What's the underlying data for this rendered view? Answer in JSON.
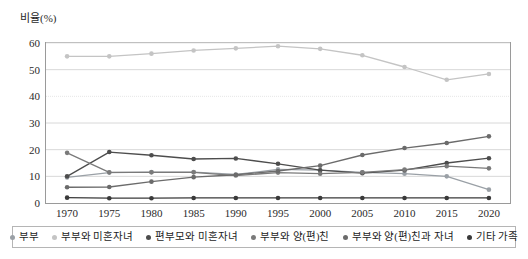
{
  "chart_data": {
    "type": "line",
    "title": "비율(%)",
    "xlabel": "",
    "ylabel": "비율(%)",
    "ylim": [
      0,
      60
    ],
    "ytick_step": 10,
    "yticks": [
      0,
      10,
      20,
      30,
      40,
      50,
      60
    ],
    "grid": true,
    "legend_position": "bottom",
    "categories": [
      "1970",
      "1975",
      "1980",
      "1985",
      "1990",
      "1995",
      "2000",
      "2005",
      "2010",
      "2015",
      "2020"
    ],
    "series": [
      {
        "name": "부부",
        "color": "#9aa0a6",
        "values": [
          9.6,
          11.4,
          11.6,
          11.6,
          10.7,
          12.6,
          12.3,
          11.5,
          11.0,
          10.0,
          5.0
        ]
      },
      {
        "name": "부부와 미혼자녀",
        "color": "#c4c4c4",
        "values": [
          55.0,
          55.0,
          56.0,
          57.2,
          58.0,
          58.8,
          57.8,
          55.4,
          51.0,
          46.2,
          48.4
        ]
      },
      {
        "name": "편부모와 미혼자녀",
        "color": "#4d4d4d",
        "values": [
          10.0,
          19.1,
          17.9,
          16.5,
          16.7,
          14.7,
          12.3,
          11.2,
          12.3,
          15.0,
          16.8
        ]
      },
      {
        "name": "부부와 양(편)친",
        "color": "#7a7a7a",
        "values": [
          18.8,
          11.5,
          11.5,
          11.5,
          10.3,
          11.4,
          11.0,
          11.5,
          12.5,
          13.8,
          13.0
        ]
      },
      {
        "name": "부부와 양(편)친과 자녀",
        "color": "#6b6b6b",
        "values": [
          5.9,
          6.0,
          8.0,
          9.7,
          10.6,
          12.0,
          14.0,
          18.0,
          20.6,
          22.5,
          25.0
        ]
      },
      {
        "name": "기타 가족",
        "color": "#3a3a3a",
        "values": [
          2.0,
          1.8,
          1.8,
          1.9,
          1.9,
          1.9,
          1.9,
          1.9,
          1.9,
          1.9,
          1.9
        ]
      }
    ]
  }
}
